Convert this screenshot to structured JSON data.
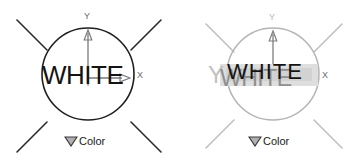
{
  "canvas": {
    "width": 364,
    "height": 165,
    "background": "#ffffff"
  },
  "colors": {
    "ink_dark": "#141414",
    "ink_mid": "#6b6b6b",
    "ink_light": "#b9b9b9",
    "ink_pale": "#cfcfcf",
    "selection_band": "#dedede",
    "selection_band_alt": "#d2d2d2"
  },
  "panels": [
    {
      "id": "left",
      "state": "normal",
      "gizmo": {
        "name": "light-gizmo",
        "circle": {
          "cx": 88,
          "cy": 74,
          "r": 46,
          "stroke": "#1f1f1f"
        },
        "rays": [
          {
            "x1": 17,
            "y1": 152,
            "x2": 47,
            "y2": 122
          },
          {
            "x1": 17,
            "y1": 20,
            "x2": 47,
            "y2": 50
          },
          {
            "x1": 160,
            "y1": 20,
            "x2": 130,
            "y2": 50
          },
          {
            "x1": 160,
            "y1": 152,
            "x2": 130,
            "y2": 122
          }
        ],
        "axes": {
          "y": {
            "label": "Y",
            "stroke": "#6b6b6b"
          },
          "x": {
            "label": "X",
            "stroke": "#6b6b6b"
          }
        }
      },
      "value_text": "WHITE",
      "dropdown": {
        "label": "Color",
        "marker": "triangle-down-icon"
      }
    },
    {
      "id": "right",
      "state": "dimmed-editing",
      "gizmo": {
        "name": "light-gizmo",
        "circle": {
          "cx": 88,
          "cy": 74,
          "r": 46,
          "stroke": "#b9b9b9"
        },
        "rays": [
          {
            "x1": 17,
            "y1": 152,
            "x2": 47,
            "y2": 122
          },
          {
            "x1": 17,
            "y1": 20,
            "x2": 47,
            "y2": 50
          },
          {
            "x1": 160,
            "y1": 20,
            "x2": 130,
            "y2": 50
          },
          {
            "x1": 160,
            "y1": 152,
            "x2": 130,
            "y2": 122
          }
        ],
        "axes": {
          "y": {
            "label": "Y",
            "stroke": "#9a9a9a"
          },
          "x": {
            "label": "X",
            "stroke": "#9a9a9a"
          }
        }
      },
      "value_text": "WHITE",
      "value_text_overlay": "WHITE",
      "value_text_ghost": "Y",
      "dropdown": {
        "label": "Color",
        "marker": "triangle-down-icon"
      }
    }
  ]
}
